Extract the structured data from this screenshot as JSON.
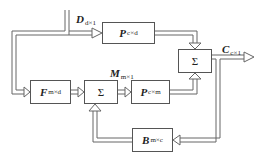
{
  "diagram": {
    "type": "block-diagram",
    "blocks": {
      "p_cd": {
        "symbol": "P",
        "sub": "c×d"
      },
      "sum_out": {
        "symbol": "Σ"
      },
      "f_md": {
        "symbol": "F",
        "sub": "m×d"
      },
      "sum_mid": {
        "symbol": "Σ"
      },
      "p_cm": {
        "symbol": "P",
        "sub": "c×m"
      },
      "b_mc": {
        "symbol": "B",
        "sub": "m×c"
      }
    },
    "signals": {
      "d": {
        "symbol": "D",
        "sub": "d×1"
      },
      "m": {
        "symbol": "M",
        "sub": "m×1"
      },
      "c": {
        "symbol": "C",
        "sub": "c×1"
      }
    },
    "colors": {
      "line": "#555555",
      "text": "#222222",
      "background": "#ffffff"
    }
  }
}
